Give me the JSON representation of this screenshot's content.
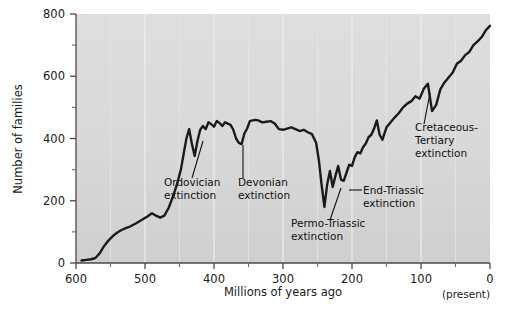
{
  "chart_data": {
    "type": "line",
    "title": "",
    "xlabel": "Millions of years ago",
    "ylabel": "Number of families",
    "xlim": [
      600,
      0
    ],
    "ylim": [
      0,
      800
    ],
    "x_reversed": true,
    "grid": "vertical-light",
    "legend": "none",
    "plot_background": "#d9d9d9",
    "line_color": "#1a1a1a",
    "x_ticks": [
      600,
      500,
      400,
      300,
      200,
      100,
      0
    ],
    "x_tick_labels": [
      "600",
      "500",
      "400",
      "300",
      "200",
      "100",
      "0"
    ],
    "x_minor_ticks": [
      550,
      450,
      350,
      250,
      150,
      50
    ],
    "y_ticks": [
      0,
      200,
      400,
      600,
      800
    ],
    "y_tick_labels": [
      "0",
      "200",
      "400",
      "600",
      "800"
    ],
    "y_minor_ticks": [
      100,
      300,
      500,
      700
    ],
    "present_note": "(present)",
    "series": [
      {
        "name": "Marine animal families",
        "x": [
          592,
          585,
          578,
          572,
          566,
          560,
          553,
          546,
          540,
          534,
          528,
          521,
          514,
          508,
          502,
          496,
          490,
          484,
          478,
          472,
          466,
          460,
          454,
          448,
          444,
          440,
          436,
          432,
          428,
          424,
          420,
          416,
          412,
          408,
          404,
          400,
          396,
          392,
          388,
          384,
          380,
          376,
          372,
          368,
          364,
          360,
          356,
          352,
          348,
          344,
          340,
          336,
          330,
          324,
          318,
          312,
          306,
          300,
          294,
          288,
          282,
          276,
          270,
          264,
          258,
          252,
          248,
          244,
          240,
          236,
          232,
          228,
          224,
          220,
          216,
          212,
          208,
          204,
          200,
          196,
          192,
          188,
          184,
          180,
          176,
          172,
          168,
          164,
          160,
          156,
          150,
          144,
          138,
          132,
          126,
          120,
          114,
          108,
          102,
          96,
          90,
          84,
          78,
          72,
          66,
          60,
          54,
          48,
          42,
          36,
          30,
          24,
          18,
          12,
          6,
          0
        ],
        "y": [
          8,
          10,
          12,
          16,
          30,
          52,
          72,
          88,
          98,
          106,
          112,
          118,
          126,
          134,
          142,
          150,
          160,
          152,
          146,
          152,
          176,
          210,
          250,
          300,
          350,
          400,
          430,
          382,
          344,
          392,
          428,
          440,
          430,
          452,
          446,
          438,
          456,
          450,
          440,
          452,
          448,
          444,
          428,
          400,
          386,
          382,
          416,
          432,
          456,
          458,
          460,
          458,
          452,
          454,
          456,
          448,
          430,
          428,
          432,
          436,
          430,
          424,
          428,
          420,
          414,
          386,
          330,
          250,
          180,
          252,
          296,
          244,
          280,
          312,
          268,
          264,
          290,
          316,
          312,
          340,
          356,
          352,
          372,
          384,
          404,
          412,
          432,
          458,
          412,
          396,
          436,
          452,
          468,
          482,
          500,
          512,
          520,
          536,
          528,
          560,
          576,
          488,
          508,
          558,
          580,
          596,
          612,
          640,
          650,
          668,
          678,
          700,
          712,
          726,
          748,
          762
        ]
      }
    ],
    "annotations": [
      {
        "label": "Ordovician extinction",
        "lines": [
          "Ordovician",
          "extinction"
        ],
        "text_x": 164,
        "text_y": 186,
        "leader": {
          "x1": 192,
          "y1": 178,
          "x2": 203,
          "y2": 141
        }
      },
      {
        "label": "Devonian extinction",
        "lines": [
          "Devonian",
          "extinction"
        ],
        "text_x": 238,
        "text_y": 186,
        "leader": {
          "x1": 243,
          "y1": 178,
          "x2": 243,
          "y2": 145
        }
      },
      {
        "label": "Permo-Triassic extinction",
        "lines": [
          "Permo-Triassic",
          "extinction"
        ],
        "text_x": 291,
        "text_y": 227,
        "leader": {
          "x1": 330,
          "y1": 220,
          "x2": 341,
          "y2": 188
        }
      },
      {
        "label": "End-Triassic extinction",
        "lines": [
          "End-Triassic",
          "extinction"
        ],
        "text_x": 363,
        "text_y": 194,
        "leader": {
          "x1": 362,
          "y1": 190,
          "x2": 349,
          "y2": 190
        }
      },
      {
        "label": "Cretaceous-Tertiary extinction",
        "lines": [
          "Cretaceous-",
          "Tertiary",
          "extinction"
        ],
        "text_x": 415,
        "text_y": 131,
        "leader": {
          "x1": 424,
          "y1": 124,
          "x2": 430,
          "y2": 93
        }
      }
    ]
  },
  "figure": {
    "background": "#ffffff",
    "plot_fill_top": "#dcdcdc",
    "plot_fill_bottom": "#d2d2d2",
    "axis_color": "#4a4a4a"
  }
}
